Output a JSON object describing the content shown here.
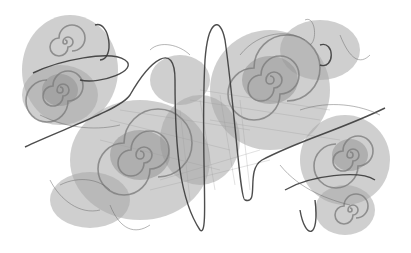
{
  "image": {
    "subject": "grayscale fractal with spiral arms and dark looping curves",
    "width": 411,
    "height": 253,
    "background": "#ffffff",
    "colors": {
      "cloud": "#a8a8a8",
      "spiral": "#7d7d7d",
      "loops": "#3a3a3a"
    },
    "spirals": [
      {
        "name": "upper-left-spiral",
        "cx": 60,
        "cy": 90,
        "r": 28
      },
      {
        "name": "lower-left-spiral",
        "cx": 140,
        "cy": 155,
        "r": 42
      },
      {
        "name": "upper-right-spiral",
        "cx": 270,
        "cy": 80,
        "r": 40
      },
      {
        "name": "lower-right-spiral",
        "cx": 350,
        "cy": 155,
        "r": 30
      },
      {
        "name": "top-left-small-spiral",
        "cx": 65,
        "cy": 42,
        "r": 16
      },
      {
        "name": "bottom-right-small-spiral",
        "cx": 350,
        "cy": 210,
        "r": 14
      }
    ]
  }
}
